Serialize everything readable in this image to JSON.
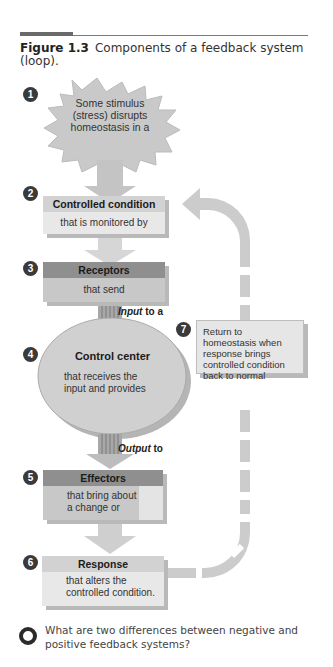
{
  "figure": {
    "number": "Figure 1.3",
    "title": "Components of a feedback system (loop)."
  },
  "steps": [
    {
      "num": "1",
      "text": "Some stimulus (stress) disrupts homeostasis in a"
    },
    {
      "num": "2",
      "header": "Controlled condition",
      "text": "that is monitored by"
    },
    {
      "num": "3",
      "header": "Receptors",
      "text": "that send"
    },
    {
      "num": "4",
      "header": "Control center",
      "text": "that receives the input and provides"
    },
    {
      "num": "5",
      "header": "Effectors",
      "text": "that bring about a change or"
    },
    {
      "num": "6",
      "header": "Response",
      "text": "that alters the controlled condition."
    },
    {
      "num": "7",
      "text": "Return to homeostasis when response brings controlled condition back to normal"
    }
  ],
  "connectors": {
    "input": {
      "em": "Input",
      "rest": " to a"
    },
    "output": {
      "em": "Output",
      "rest": " to"
    }
  },
  "question": {
    "icon": "Q",
    "text": "What are two differences between negative and positive feedback systems?"
  }
}
